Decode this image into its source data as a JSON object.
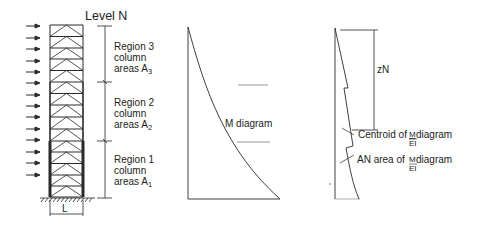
{
  "frame": {
    "title": "Level N",
    "regions": [
      {
        "name": "Region 3",
        "line2": "column",
        "line3": "areas A",
        "sub": "3"
      },
      {
        "name": "Region 2",
        "line2": "column",
        "line3": "areas A",
        "sub": "2"
      },
      {
        "name": "Region 1",
        "line2": "column",
        "line3": "areas A",
        "sub": "1"
      }
    ],
    "width_label": "L",
    "stories": 12,
    "load_arrows": 13
  },
  "m_diagram": {
    "label": "M diagram"
  },
  "mei_diagram": {
    "distance_label": "zN",
    "centroid_label_pre": "Centroid of ",
    "centroid_frac_num": "M",
    "centroid_frac_den": "EI",
    "centroid_label_post": " diagram",
    "area_label_pre": "AN area of ",
    "area_frac_num": "M",
    "area_frac_den": "EI",
    "area_label_post": " diagram"
  },
  "colors": {
    "line": "#2a2a2a",
    "text": "#222222",
    "background": "#ffffff"
  }
}
